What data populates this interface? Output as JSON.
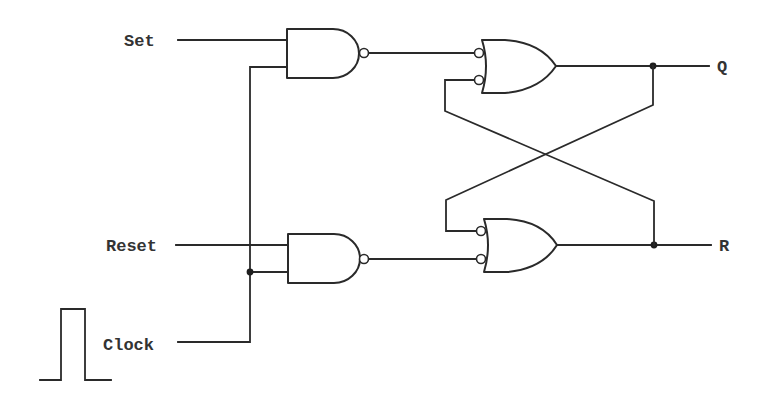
{
  "diagram": {
    "type": "logic-circuit",
    "inputs": {
      "set": "Set",
      "reset": "Reset",
      "clock": "Clock"
    },
    "outputs": {
      "q": "Q",
      "r": "R"
    },
    "gates": [
      {
        "id": "nand-top",
        "kind": "NAND",
        "inputs": [
          "Set",
          "Clock"
        ],
        "output": "to or-top input 1"
      },
      {
        "id": "nand-bottom",
        "kind": "NAND",
        "inputs": [
          "Reset",
          "Clock"
        ],
        "output": "to or-bottom input 2"
      },
      {
        "id": "or-top",
        "kind": "OR (inverted inputs)",
        "inputs": [
          "nand-top",
          "feedback from R"
        ],
        "output": "Q"
      },
      {
        "id": "or-bottom",
        "kind": "OR (inverted inputs)",
        "inputs": [
          "feedback from Q",
          "nand-bottom"
        ],
        "output": "R"
      }
    ],
    "clock_waveform": "single-pulse",
    "colors": {
      "line": "#2a2a2a",
      "text": "#333333",
      "background": "#ffffff"
    }
  }
}
